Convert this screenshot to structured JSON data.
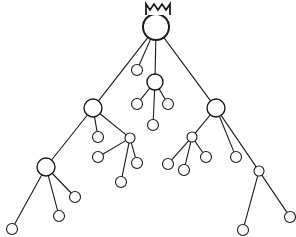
{
  "diagram": {
    "type": "tree",
    "colors": {
      "stroke": "#1a1a1a",
      "fill": "#ffffff",
      "background": "#ffffff"
    },
    "root": {
      "id": "root",
      "x": 156,
      "y": 27,
      "r": 13,
      "crown": true
    },
    "nodes": [
      {
        "id": "root",
        "x": 156,
        "y": 27,
        "r": 13,
        "kind": "root"
      },
      {
        "id": "a",
        "x": 93,
        "y": 108,
        "r": 9,
        "kind": "mid"
      },
      {
        "id": "b",
        "x": 137,
        "y": 70,
        "r": 5.5,
        "kind": "leaf"
      },
      {
        "id": "c",
        "x": 155,
        "y": 82,
        "r": 8,
        "kind": "mid"
      },
      {
        "id": "d",
        "x": 216,
        "y": 108,
        "r": 9,
        "kind": "mid"
      },
      {
        "id": "c1",
        "x": 137,
        "y": 104,
        "r": 5.5,
        "kind": "leaf"
      },
      {
        "id": "c2",
        "x": 168,
        "y": 104,
        "r": 5.5,
        "kind": "leaf"
      },
      {
        "id": "c3",
        "x": 153,
        "y": 125,
        "r": 5.5,
        "kind": "leaf"
      },
      {
        "id": "e",
        "x": 46,
        "y": 167,
        "r": 9,
        "kind": "mid"
      },
      {
        "id": "a1",
        "x": 98,
        "y": 137,
        "r": 5.5,
        "kind": "leaf"
      },
      {
        "id": "f",
        "x": 130,
        "y": 138,
        "r": 5,
        "kind": "small"
      },
      {
        "id": "f1",
        "x": 98,
        "y": 157,
        "r": 5.5,
        "kind": "leaf"
      },
      {
        "id": "f2",
        "x": 137,
        "y": 163,
        "r": 5.5,
        "kind": "leaf"
      },
      {
        "id": "f3",
        "x": 121,
        "y": 182,
        "r": 5.5,
        "kind": "leaf"
      },
      {
        "id": "g",
        "x": 192,
        "y": 137,
        "r": 5,
        "kind": "small"
      },
      {
        "id": "g1",
        "x": 168,
        "y": 164,
        "r": 5.5,
        "kind": "leaf"
      },
      {
        "id": "g2",
        "x": 184,
        "y": 170,
        "r": 5.5,
        "kind": "leaf"
      },
      {
        "id": "g3",
        "x": 206,
        "y": 157,
        "r": 5.5,
        "kind": "leaf"
      },
      {
        "id": "d1",
        "x": 236,
        "y": 157,
        "r": 5.5,
        "kind": "leaf"
      },
      {
        "id": "h",
        "x": 259,
        "y": 171,
        "r": 5,
        "kind": "small"
      },
      {
        "id": "h1",
        "x": 243,
        "y": 230,
        "r": 5.5,
        "kind": "leaf"
      },
      {
        "id": "h2",
        "x": 290,
        "y": 217,
        "r": 5.5,
        "kind": "leaf"
      },
      {
        "id": "e1",
        "x": 75,
        "y": 197,
        "r": 5.5,
        "kind": "leaf"
      },
      {
        "id": "e2",
        "x": 59,
        "y": 216,
        "r": 5.5,
        "kind": "leaf"
      },
      {
        "id": "e3",
        "x": 12,
        "y": 229,
        "r": 5.5,
        "kind": "leaf"
      }
    ],
    "edges": [
      [
        "root",
        "a"
      ],
      [
        "root",
        "b"
      ],
      [
        "root",
        "c"
      ],
      [
        "root",
        "d"
      ],
      [
        "c",
        "c1"
      ],
      [
        "c",
        "c2"
      ],
      [
        "c",
        "c3"
      ],
      [
        "a",
        "e"
      ],
      [
        "a",
        "a1"
      ],
      [
        "a",
        "f"
      ],
      [
        "f",
        "f1"
      ],
      [
        "f",
        "f2"
      ],
      [
        "f",
        "f3"
      ],
      [
        "d",
        "g"
      ],
      [
        "d",
        "d1"
      ],
      [
        "d",
        "h"
      ],
      [
        "g",
        "g1"
      ],
      [
        "g",
        "g2"
      ],
      [
        "g",
        "g3"
      ],
      [
        "h",
        "h1"
      ],
      [
        "h",
        "h2"
      ],
      [
        "e",
        "e1"
      ],
      [
        "e",
        "e2"
      ],
      [
        "e",
        "e3"
      ]
    ]
  }
}
